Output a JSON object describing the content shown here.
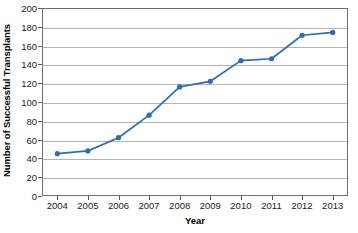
{
  "chart_data": {
    "type": "line",
    "title": "",
    "xlabel": "Year",
    "ylabel": "Number of Successful Transplants",
    "categories": [
      "2004",
      "2005",
      "2006",
      "2007",
      "2008",
      "2009",
      "2010",
      "2011",
      "2012",
      "2013"
    ],
    "values": [
      45,
      48,
      62,
      86,
      116,
      122,
      144,
      146,
      171,
      174
    ],
    "series": [
      {
        "name": "Successful Transplants",
        "values": [
          45,
          48,
          62,
          86,
          116,
          122,
          144,
          146,
          171,
          174
        ]
      }
    ],
    "ylim": [
      0,
      200
    ],
    "ytick_step": 20,
    "yticks": [
      "200",
      "180",
      "160",
      "140",
      "120",
      "100",
      "80",
      "60",
      "40",
      "20",
      "0"
    ],
    "grid": true,
    "grid_axis": "y",
    "legend": false,
    "legend_position": "none",
    "marker": "circle",
    "colors": {
      "series_line": "#2E6DB4",
      "series_marker": "#2E6DB4",
      "gridline": "#b4b4b4",
      "frame": "#6e6e6e",
      "background": "#ffffff",
      "text": "#1b1b1b"
    }
  }
}
